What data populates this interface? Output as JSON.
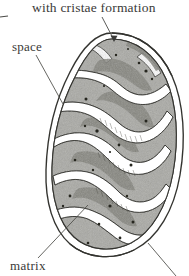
{
  "figure": {
    "style": "electron-micrograph line drawing, grayscale",
    "background_color": "#ffffff",
    "ink_color": "#3a3a38",
    "matrix_fill": "#a9a9a4",
    "matrix_dark_fill": "#8d8d86",
    "crista_fill": "#ffffff",
    "granule_color": "#2b2b29"
  },
  "labels": {
    "cristae": "with cristae formation",
    "space": "space",
    "matrix": "matrix"
  },
  "leaders": {
    "cristae_arrow": "arrow from caption down-right to outer membrane at top of organelle",
    "space_line": "line from 'space' label down-right to intermembrane space at left edge",
    "matrix_line": "line from 'matrix' label up-right into a matrix compartment",
    "bottom_right_line": "line from lower-right membrane running off the bottom-right corner",
    "left_edge_tick": "short horizontal tick cropped at the left edge"
  }
}
